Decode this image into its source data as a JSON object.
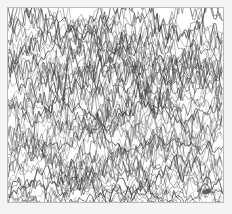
{
  "page": {
    "background_color": "#f4f4f4",
    "frame_color": "#b9b9b9",
    "plot_background": "#ffffff",
    "trace_color": "#333333",
    "title": "",
    "caption": ""
  },
  "figure": {
    "name": "multi-trace-waveform-chart",
    "frame": {
      "x": 7,
      "y": 7,
      "width": 217,
      "height": 196
    },
    "ink_mark": {
      "name": "ink-blob",
      "label": ""
    }
  },
  "chart_data": {
    "type": "line",
    "title": "",
    "subtitle": "",
    "xlabel": "",
    "ylabel": "",
    "xlim": [
      0,
      215
    ],
    "ylim": [
      0,
      194
    ],
    "grid": false,
    "legend": null,
    "axis_ticks": {
      "x": [],
      "y": []
    },
    "annotations": [],
    "style": {
      "stroke": "#333333",
      "stroke_width": 0.55,
      "opacity": 0.88,
      "fill": "none"
    },
    "trace_count": 72,
    "baseline_count": 9,
    "baselines": [
      18,
      40,
      62,
      84,
      106,
      128,
      150,
      172,
      190
    ],
    "band_amplitude": 26,
    "sample_spacing_px": 2.1,
    "noise_scale": 0.55,
    "seed": 20240517,
    "series": [
      {
        "name": "trace-band-1",
        "baseline": 18,
        "amplitude": 26,
        "spikiness": 0.72
      },
      {
        "name": "trace-band-2",
        "baseline": 40,
        "amplitude": 26,
        "spikiness": 0.78
      },
      {
        "name": "trace-band-3",
        "baseline": 62,
        "amplitude": 27,
        "spikiness": 0.8
      },
      {
        "name": "trace-band-4",
        "baseline": 84,
        "amplitude": 27,
        "spikiness": 0.82
      },
      {
        "name": "trace-band-5",
        "baseline": 106,
        "amplitude": 27,
        "spikiness": 0.84
      },
      {
        "name": "trace-band-6",
        "baseline": 128,
        "amplitude": 26,
        "spikiness": 0.82
      },
      {
        "name": "trace-band-7",
        "baseline": 150,
        "amplitude": 26,
        "spikiness": 0.78
      },
      {
        "name": "trace-band-8",
        "baseline": 172,
        "amplitude": 24,
        "spikiness": 0.72
      },
      {
        "name": "trace-band-9",
        "baseline": 190,
        "amplitude": 16,
        "spikiness": 0.6
      }
    ]
  }
}
